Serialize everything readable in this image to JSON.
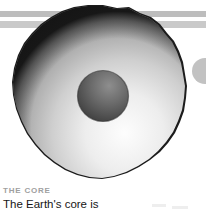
{
  "page": {
    "background_color": "#ffffff",
    "width": 206,
    "height": 215
  },
  "rules": [
    {
      "name": "top-rule-upper",
      "color": "#bdbdbd"
    },
    {
      "name": "top-rule-lower",
      "color": "#c9c9c9"
    }
  ],
  "illustration": {
    "name": "earth-core-cutaway",
    "alt_text": "Grayscale cutaway illustration of the Earth showing the inner core",
    "outer_shell_edge_color": "#1c1c1c",
    "mantle_highlight_color": "#fdfdfd",
    "mantle_mid_color": "#b9b9b9",
    "mantle_shadow_color": "#6d6d6d",
    "core_color": "#6b6b6b",
    "core_shadow_color": "#3d3d3d",
    "core_highlight_color": "#8e8e8e"
  },
  "edge_circle": {
    "name": "clipped-circle-right-edge",
    "color": "#c2c2c2"
  },
  "caption": {
    "kicker": "THE CORE",
    "kicker_color": "#a0a0a0",
    "body": "The Earth's core is",
    "body_color": "#161616"
  }
}
